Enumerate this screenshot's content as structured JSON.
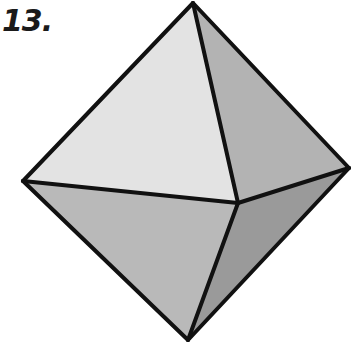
{
  "problem": {
    "number_label": "13."
  },
  "figure": {
    "shape": "octahedron",
    "vertices": {
      "top": [
        193,
        3
      ],
      "left": [
        23,
        181
      ],
      "right": [
        349,
        168
      ],
      "front": [
        238,
        203
      ],
      "bottom": [
        188,
        340
      ]
    },
    "faces": [
      {
        "name": "upper-front-face",
        "points": "top,left,front",
        "fill": "#e3e3e3"
      },
      {
        "name": "upper-right-face",
        "points": "top,front,right",
        "fill": "#b3b3b3"
      },
      {
        "name": "lower-front-face",
        "points": "left,front,bottom",
        "fill": "#b9b9b9"
      },
      {
        "name": "lower-right-face",
        "points": "front,right,bottom",
        "fill": "#9a9a9a"
      }
    ],
    "edge_color": "#111111",
    "edge_width": 4
  }
}
